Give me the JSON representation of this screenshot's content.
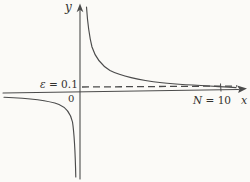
{
  "labels": {
    "y_axis": "y",
    "x_axis": "x",
    "origin": "0",
    "epsilon_symbol": "ε",
    "epsilon_rest": " = 0.1",
    "n_symbol": "N",
    "n_rest": " = 10"
  },
  "colors": {
    "background": "#fbfaf7",
    "line": "#4b4b4b",
    "text": "#33312e"
  },
  "chart_data": {
    "type": "line",
    "title": "",
    "xlabel": "x",
    "ylabel": "y",
    "origin_label": "0",
    "grid": false,
    "legend": "none",
    "annotations": [
      {
        "text": "ε = 0.1",
        "meaning": "horizontal dashed asymptote band at y = ε = 0.1, labeled left of the y-axis"
      },
      {
        "text": "N = 10",
        "meaning": "tick on the x-axis at x = N = 10, labeled below the axis"
      }
    ],
    "dashed_line": {
      "y": 0.1,
      "style": "dashed",
      "extends": "from y-axis to right arrow"
    },
    "n_tick": {
      "x": 10
    },
    "axis_range_hint": {
      "x": [
        -5.5,
        12
      ],
      "y": [
        -3,
        2.5
      ]
    },
    "series": [
      {
        "name": "curve-positive-branch (y = 1/x, x > 0)",
        "x": [
          0.45,
          0.6,
          0.8,
          1,
          1.5,
          2,
          3,
          4,
          6,
          8,
          10,
          11
        ],
        "y": [
          2.22,
          1.67,
          1.25,
          1,
          0.67,
          0.5,
          0.33,
          0.25,
          0.17,
          0.125,
          0.1,
          0.09
        ]
      },
      {
        "name": "curve-negative-branch (y = 1/x, x < 0)",
        "x": [
          -5.4,
          -4,
          -3,
          -2,
          -1.5,
          -1,
          -0.7,
          -0.5,
          -0.35
        ],
        "y": [
          -0.19,
          -0.25,
          -0.33,
          -0.5,
          -0.67,
          -1,
          -1.43,
          -2,
          -2.86
        ]
      }
    ]
  },
  "figure": {
    "stroke": "#4b4b4b",
    "dash_pattern": "7 4",
    "x_axis_path": "M3,93 L238.5,89.5",
    "x_arrow_path": "M247,88.6 L237,85.4 L239.3,89 L238.2,92.9 Z",
    "y_axis_path": "M80,179 L80,9.5",
    "y_arrow_path": "M80,3.5 L76.6,12.2 L80,9.8 L83.4,12.2 Z",
    "dashed_line_path": "M82,87 L237,86",
    "n_tick_path": "M220.5,83.5 L221,91.5",
    "right_branch_path": "M86.5,7 C87.5,22 89,35 92,47 C95.5,58 101,65 110,70.5 C121,76 138,80 162,82.8 C188,85.3 214,86.3 236,87.6",
    "left_branch_path": "M4,97.3 C28,98.2 47,100 59,104.5 C67,107.8 70.5,113 72.5,122 C74.5,135 75.3,155 75.8,177"
  }
}
